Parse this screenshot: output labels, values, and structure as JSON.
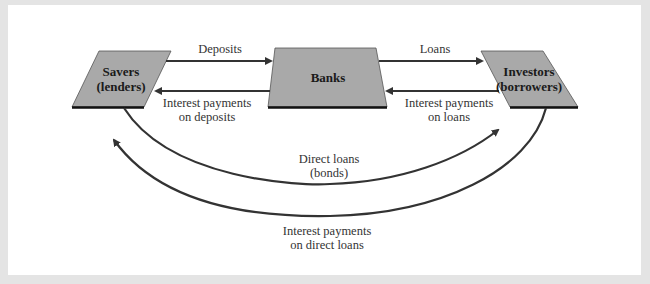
{
  "diagram": {
    "nodes": {
      "savers": {
        "line1": "Savers",
        "line2": "(lenders)"
      },
      "banks": {
        "label": "Banks"
      },
      "investors": {
        "line1": "Investors",
        "line2": "(borrowers)"
      }
    },
    "edges": {
      "deposits": "Deposits",
      "interest_deposits": {
        "line1": "Interest payments",
        "line2": "on deposits"
      },
      "loans": "Loans",
      "interest_loans": {
        "line1": "Interest payments",
        "line2": "on loans"
      },
      "direct_loans": {
        "line1": "Direct loans",
        "line2": "(bonds)"
      },
      "interest_direct": {
        "line1": "Interest payments",
        "line2": "on direct loans"
      }
    },
    "colors": {
      "node_fill": "#a9a9a9",
      "stroke": "#333333",
      "background": "#e4e4e4",
      "panel": "#ffffff"
    }
  }
}
